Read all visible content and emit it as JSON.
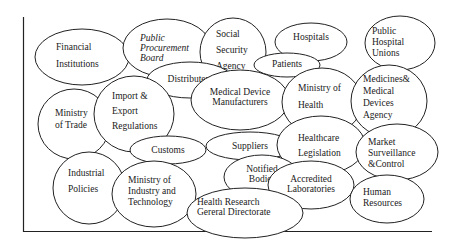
{
  "diagram": {
    "type": "stakeholder-bubble-map",
    "nodes": [
      {
        "id": "financial-institutions",
        "lines": [
          "Financial",
          "Institutions"
        ],
        "italic": false
      },
      {
        "id": "public-procurement-board",
        "lines": [
          "Public",
          "Procurement",
          "Board"
        ],
        "italic": true
      },
      {
        "id": "social-security-agency",
        "lines": [
          "Social",
          "Security",
          "Agency"
        ],
        "italic": false
      },
      {
        "id": "hospitals",
        "lines": [
          "Hospitals"
        ],
        "italic": false
      },
      {
        "id": "public-hospital-unions",
        "lines": [
          "Public",
          "Hospital",
          "Unions"
        ],
        "italic": false
      },
      {
        "id": "patients",
        "lines": [
          "Patients"
        ],
        "italic": false
      },
      {
        "id": "distributers",
        "lines": [
          "Distributers"
        ],
        "italic": false
      },
      {
        "id": "medical-device-manufacturers",
        "lines": [
          "Medical Device",
          "Manufacturers"
        ],
        "italic": false
      },
      {
        "id": "ministry-of-health",
        "lines": [
          "Ministry  of",
          "Health"
        ],
        "italic": false
      },
      {
        "id": "medicines-medical-devices-agency",
        "lines": [
          "Medicines&",
          "Medical",
          "Devices",
          "Agency"
        ],
        "italic": false
      },
      {
        "id": "ministry-of-trade",
        "lines": [
          "Ministry",
          "of Trade"
        ],
        "italic": false
      },
      {
        "id": "import-export-regulations",
        "lines": [
          "Import &",
          "Export",
          "Regulations"
        ],
        "italic": false
      },
      {
        "id": "customs",
        "lines": [
          "Customs"
        ],
        "italic": false
      },
      {
        "id": "suppliers",
        "lines": [
          "Suppliers"
        ],
        "italic": false
      },
      {
        "id": "healthcare-legislation",
        "lines": [
          "Healthcare",
          "Legislation"
        ],
        "italic": false
      },
      {
        "id": "market-surveillance-control",
        "lines": [
          "Market",
          "Surveillance",
          "&Control"
        ],
        "italic": false
      },
      {
        "id": "industrial-policies",
        "lines": [
          "Industrial",
          "Policies"
        ],
        "italic": false
      },
      {
        "id": "ministry-of-industry-technology",
        "lines": [
          "Ministry    of",
          "Industry   and",
          "Technology"
        ],
        "italic": false
      },
      {
        "id": "notified-bodies",
        "lines": [
          "Notified",
          "Bodies"
        ],
        "italic": false
      },
      {
        "id": "accredited-laboratories",
        "lines": [
          "Accredited",
          "Laboratories"
        ],
        "italic": false
      },
      {
        "id": "health-research-directorate",
        "lines": [
          "Health          Research",
          "Gereral Directorate"
        ],
        "italic": false
      },
      {
        "id": "human-resources",
        "lines": [
          "Human",
          "Resources"
        ],
        "italic": false
      }
    ]
  }
}
